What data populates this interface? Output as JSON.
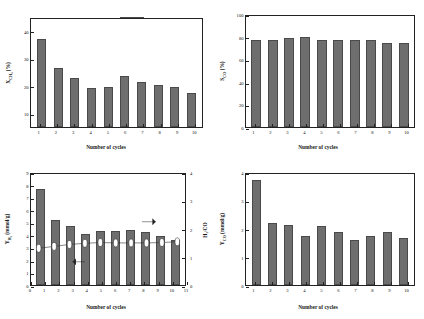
{
  "figure": {
    "legend_label": "Ca2Fe2O5",
    "legend_html": "Ca₂Fe₂O₅",
    "bar_color": "#6e6e6e",
    "bar_edge_color": "#4a4a4a",
    "line_color": "#333333",
    "frame_color": "#222222",
    "background": "#ffffff"
  },
  "chart_data": [
    {
      "type": "bar",
      "panel": "(a)",
      "title": "",
      "xlabel": "Number of cycles",
      "ylabel": "XCH4 (%)",
      "ylabel_html": "X<sub>CH₄</sub> (%)",
      "categories": [
        "1",
        "2",
        "3",
        "4",
        "5",
        "6",
        "7",
        "8",
        "9",
        "10"
      ],
      "values": [
        37.5,
        26.8,
        23.3,
        19.5,
        20.0,
        23.8,
        21.6,
        20.4,
        19.7,
        17.6
      ],
      "ylim": [
        5,
        45
      ],
      "yticks": [
        10,
        20,
        30,
        40
      ],
      "ytick_labels": [
        "10",
        "20",
        "30",
        "40"
      ],
      "grid": false,
      "legend_position": "top-right",
      "series": [
        {
          "name": "Ca₂Fe₂O₅",
          "values": [
            37.5,
            26.8,
            23.3,
            19.5,
            20.0,
            23.8,
            21.6,
            20.4,
            19.7,
            17.6
          ]
        }
      ]
    },
    {
      "type": "bar",
      "panel": "(b)",
      "title": "",
      "xlabel": "Number of cycles",
      "ylabel": "SCO (%)",
      "ylabel_html": "S<sub>CO</sub> (%)",
      "categories": [
        "1",
        "2",
        "3",
        "4",
        "5",
        "6",
        "7",
        "8",
        "9",
        "10"
      ],
      "values": [
        78.5,
        78.0,
        80.0,
        81.5,
        78.2,
        78.3,
        78.8,
        78.7,
        75.5,
        75.5
      ],
      "ylim": [
        0,
        100
      ],
      "yticks": [
        0,
        20,
        40,
        60,
        80,
        100
      ],
      "ytick_labels": [
        "0",
        "20",
        "40",
        "60",
        "80",
        "100"
      ],
      "grid": false,
      "legend_position": "top-right",
      "series": [
        {
          "name": "Ca₂Fe₂O₅",
          "values": [
            78.5,
            78.0,
            80.0,
            81.5,
            78.2,
            78.3,
            78.8,
            78.7,
            75.5,
            75.5
          ]
        }
      ]
    },
    {
      "type": "bar",
      "panel": "(c)",
      "title": "",
      "xlabel": "Number of cycles",
      "ylabel": "YH2 (mmol/g)",
      "ylabel_html": "Y<sub>H₂</sub> (mmol/g)",
      "ylabel_right": "H2/CO",
      "ylabel_right_html": "H₂/CO",
      "categories": [
        "1",
        "2",
        "3",
        "4",
        "5",
        "6",
        "7",
        "8",
        "9",
        "10"
      ],
      "values": [
        7.8,
        5.25,
        4.8,
        4.15,
        4.35,
        4.4,
        4.45,
        4.3,
        4.0,
        3.65
      ],
      "ylim": [
        0,
        9
      ],
      "yticks": [
        0,
        1,
        2,
        3,
        4,
        5,
        6,
        7,
        8,
        9
      ],
      "ytick_labels": [
        "0",
        "1",
        "2",
        "3",
        "4",
        "5",
        "6",
        "7",
        "8",
        "9"
      ],
      "xlim": [
        0,
        11
      ],
      "xticks": [
        0,
        1,
        2,
        3,
        4,
        5,
        6,
        7,
        8,
        9,
        10,
        11
      ],
      "xtick_labels": [
        "0",
        "1",
        "2",
        "3",
        "4",
        "5",
        "6",
        "7",
        "8",
        "9",
        "10",
        "11"
      ],
      "ylim_right": [
        0,
        4
      ],
      "yticks_right": [
        0,
        1,
        2,
        3,
        4
      ],
      "ytick_labels_right": [
        "0",
        "1",
        "2",
        "3",
        "4"
      ],
      "grid": false,
      "legend_position": "top-right",
      "line_values": [
        2.07,
        2.12,
        2.17,
        2.2,
        2.22,
        2.21,
        2.21,
        2.21,
        2.22,
        2.24
      ],
      "annotations": [
        "left-arrow",
        "right-arrow"
      ],
      "series": [
        {
          "name": "Ca₂Fe₂O₅",
          "type": "bar",
          "values": [
            7.8,
            5.25,
            4.8,
            4.15,
            4.35,
            4.4,
            4.45,
            4.3,
            4.0,
            3.65
          ]
        },
        {
          "name": "H₂/CO",
          "type": "line",
          "values": [
            2.07,
            2.12,
            2.17,
            2.2,
            2.22,
            2.21,
            2.21,
            2.21,
            2.22,
            2.24
          ]
        }
      ]
    },
    {
      "type": "bar",
      "panel": "(d)",
      "title": "",
      "xlabel": "Number of cycles",
      "ylabel": "YCO (mmol/g)",
      "ylabel_html": "Y<sub>CO</sub> (mmol/g)",
      "categories": [
        "1",
        "2",
        "3",
        "4",
        "5",
        "6",
        "7",
        "8",
        "9",
        "10"
      ],
      "values": [
        3.78,
        2.22,
        2.18,
        1.78,
        2.12,
        1.92,
        1.62,
        1.78,
        1.9,
        1.68
      ],
      "ylim": [
        0,
        4
      ],
      "yticks": [
        0,
        1,
        2,
        3,
        4
      ],
      "ytick_labels": [
        "0",
        "1",
        "2",
        "3",
        "4"
      ],
      "grid": false,
      "legend_position": "top-right",
      "series": [
        {
          "name": "Ca₂Fe₂O₅",
          "values": [
            3.78,
            2.22,
            2.18,
            1.78,
            2.12,
            1.92,
            1.62,
            1.78,
            1.9,
            1.68
          ]
        }
      ]
    }
  ]
}
